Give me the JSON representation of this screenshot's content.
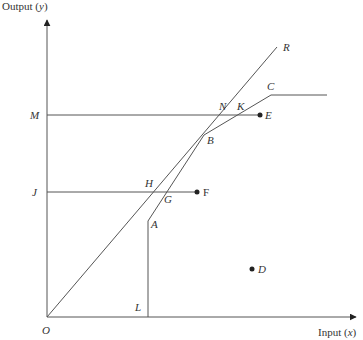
{
  "diagram": {
    "axes": {
      "y_title": "Output (y)",
      "x_title": "Input (x)",
      "origin_label": "O",
      "origin": [
        47,
        317
      ],
      "y_axis_top": [
        47,
        20
      ],
      "x_axis_right": [
        356,
        317
      ]
    },
    "lines": [
      {
        "name": "ray-OR",
        "points": [
          [
            47,
            317
          ],
          [
            277,
            47
          ]
        ]
      },
      {
        "name": "frontier-LACplateau",
        "points": [
          [
            148,
            317
          ],
          [
            148,
            221
          ],
          [
            204,
            135
          ],
          [
            271,
            95
          ],
          [
            327,
            95
          ]
        ]
      },
      {
        "name": "horizontal-ME",
        "points": [
          [
            47,
            115
          ],
          [
            260,
            115
          ]
        ]
      },
      {
        "name": "horizontal-JF",
        "points": [
          [
            47,
            192
          ],
          [
            197,
            192
          ]
        ]
      }
    ],
    "dots": [
      {
        "name": "E",
        "pos": [
          260,
          115
        ]
      },
      {
        "name": "F",
        "pos": [
          197,
          192
        ]
      },
      {
        "name": "D",
        "pos": [
          252,
          269
        ]
      }
    ],
    "labels": [
      {
        "text": "Output (y)",
        "x": 2,
        "y": 10,
        "cls": "axis-title"
      },
      {
        "text": "Input (x)",
        "x": 318,
        "y": 336,
        "cls": "axis-title"
      },
      {
        "text": "O",
        "x": 42,
        "y": 334,
        "cls": "pt-label"
      },
      {
        "text": "M",
        "x": 30,
        "y": 119,
        "cls": "pt-label"
      },
      {
        "text": "J",
        "x": 32,
        "y": 196,
        "cls": "pt-label"
      },
      {
        "text": "R",
        "x": 283,
        "y": 51,
        "cls": "pt-label"
      },
      {
        "text": "C",
        "x": 267,
        "y": 90,
        "cls": "pt-label"
      },
      {
        "text": "N",
        "x": 219,
        "y": 110,
        "cls": "pt-label"
      },
      {
        "text": "K",
        "x": 237,
        "y": 110,
        "cls": "pt-label"
      },
      {
        "text": "E",
        "x": 265,
        "y": 119,
        "cls": "pt-label"
      },
      {
        "text": "B",
        "x": 207,
        "y": 144,
        "cls": "pt-label"
      },
      {
        "text": "H",
        "x": 145,
        "y": 187,
        "cls": "pt-label"
      },
      {
        "text": "G",
        "x": 164,
        "y": 203,
        "cls": "pt-label"
      },
      {
        "text": "F",
        "x": 203,
        "y": 196,
        "cls": "pt-label upright"
      },
      {
        "text": "A",
        "x": 151,
        "y": 228,
        "cls": "pt-label"
      },
      {
        "text": "D",
        "x": 258,
        "y": 273,
        "cls": "pt-label"
      },
      {
        "text": "L",
        "x": 135,
        "y": 311,
        "cls": "pt-label"
      }
    ],
    "colors": {
      "line": "#555555",
      "dot": "#222222",
      "text": "#333333"
    }
  }
}
